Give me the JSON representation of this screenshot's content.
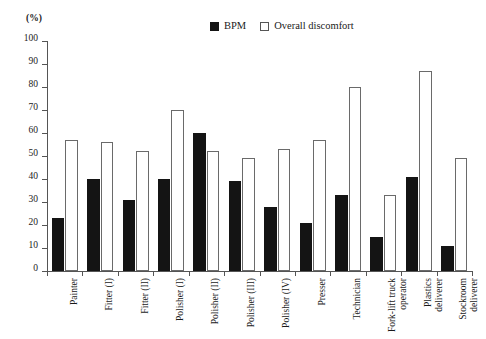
{
  "chart_data": {
    "type": "bar",
    "title": "",
    "subtitle": "",
    "xlabel": "",
    "ylabel": "(%)",
    "unit_label": "(%)",
    "ylim": [
      0,
      100
    ],
    "ytick_values": [
      0,
      10,
      20,
      30,
      40,
      50,
      60,
      70,
      80,
      90,
      100
    ],
    "ytick_labels": [
      "0",
      "10",
      "20",
      "30",
      "40",
      "50",
      "60",
      "70",
      "80",
      "90",
      "100"
    ],
    "grid": false,
    "legend_position": "top-right",
    "categories": [
      "Painter",
      "Fitter (I)",
      "Fitter (II)",
      "Polisher (I)",
      "Polisher (II)",
      "Polisher (III)",
      "Polisher (IV)",
      "Presser",
      "Technician",
      "Fork-lift truck\noperator",
      "Plastics\ndeliverer",
      "Stockroom\ndeliverer"
    ],
    "series": [
      {
        "name": "BPM",
        "color": "#141414",
        "style": "filled",
        "values": [
          23,
          40,
          31,
          40,
          60,
          39,
          28,
          21,
          33,
          15,
          41,
          11
        ]
      },
      {
        "name": "Overall discomfort",
        "color": "#ffffff",
        "style": "open",
        "values": [
          57,
          56,
          52,
          70,
          52,
          49,
          53,
          57,
          80,
          33,
          87,
          49
        ]
      }
    ]
  },
  "legend": {
    "items": [
      {
        "label": "BPM",
        "swatch": "filled-square-icon"
      },
      {
        "label": "Overall discomfort",
        "swatch": "open-square-icon"
      }
    ]
  },
  "colors": {
    "bpm_fill": "#141414",
    "discomfort_fill": "#ffffff",
    "discomfort_stroke": "#6a6a6a",
    "axis": "#555555",
    "background": "#ffffff",
    "text": "#1a1a1a"
  }
}
